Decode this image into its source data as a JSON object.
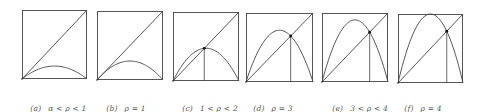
{
  "figure": {
    "stroke_color": "#444444",
    "panels": [
      {
        "id": "a",
        "tag": "(a)",
        "condition": "α < ρ < 1",
        "rho": 0.75,
        "show_fixed_point": false
      },
      {
        "id": "b",
        "tag": "(b)",
        "condition": "ρ = 1",
        "rho": 1.1,
        "show_fixed_point": false
      },
      {
        "id": "c",
        "tag": "(c)",
        "condition": "1 < ρ < 2",
        "rho": 1.9,
        "show_fixed_point": true
      },
      {
        "id": "d",
        "tag": "(d)",
        "condition": "ρ = 3",
        "rho": 3.0,
        "show_fixed_point": true
      },
      {
        "id": "e",
        "tag": "(e)",
        "condition": "3 < ρ < 4",
        "rho": 3.6,
        "show_fixed_point": true
      },
      {
        "id": "f",
        "tag": "(f)",
        "condition": "ρ = 4",
        "rho": 4.0,
        "show_fixed_point": true
      }
    ]
  }
}
